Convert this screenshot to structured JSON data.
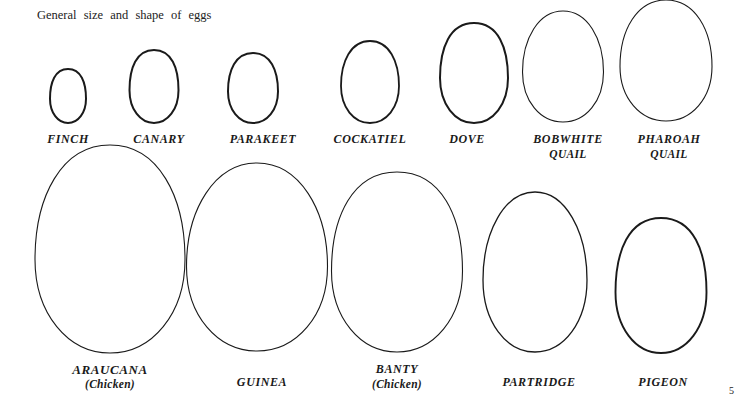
{
  "page": {
    "title": "General size and shape of eggs",
    "page_number": "5"
  },
  "eggs": [
    {
      "name": "FINCH",
      "sub": "",
      "cx": 68,
      "top": 69,
      "bottom": 123,
      "w": 36,
      "stroke": 2.0,
      "taper": 0.04,
      "label_x": 68,
      "label_y": 132
    },
    {
      "name": "CANARY",
      "sub": "",
      "cx": 154,
      "top": 50,
      "bottom": 123,
      "w": 49,
      "stroke": 2.0,
      "taper": 0.04,
      "label_x": 159,
      "label_y": 132
    },
    {
      "name": "PARAKEET",
      "sub": "",
      "cx": 253,
      "top": 53,
      "bottom": 123,
      "w": 50,
      "stroke": 2.0,
      "taper": 0.07,
      "label_x": 263,
      "label_y": 132
    },
    {
      "name": "COCKATIEL",
      "sub": "",
      "cx": 370,
      "top": 41,
      "bottom": 123,
      "w": 58,
      "stroke": 1.8,
      "taper": 0.12,
      "label_x": 370,
      "label_y": 132
    },
    {
      "name": "DOVE",
      "sub": "",
      "cx": 474,
      "top": 23,
      "bottom": 123,
      "w": 68,
      "stroke": 2.0,
      "taper": 0.05,
      "label_x": 467,
      "label_y": 132
    },
    {
      "name": "BOBWHITE",
      "sub": "QUAIL",
      "cx": 563,
      "top": 11,
      "bottom": 122,
      "w": 81,
      "stroke": 1.1,
      "taper": 0.2,
      "label_x": 568,
      "label_y": 132
    },
    {
      "name": "PHAROAH",
      "sub": "QUAIL",
      "cx": 666,
      "top": 0,
      "bottom": 121,
      "w": 92,
      "stroke": 1.1,
      "taper": 0.16,
      "label_x": 669,
      "label_y": 132
    },
    {
      "name": "ARAUCANA",
      "sub": "(Chicken)",
      "cx": 110,
      "top": 145,
      "bottom": 353,
      "w": 150,
      "stroke": 1.1,
      "taper": 0.14,
      "label_x": 110,
      "label_y": 362,
      "big": true
    },
    {
      "name": "GUINEA",
      "sub": "",
      "cx": 257,
      "top": 163,
      "bottom": 351,
      "w": 141,
      "stroke": 1.1,
      "taper": 0.2,
      "label_x": 262,
      "label_y": 375
    },
    {
      "name": "BANTY",
      "sub": "(Chicken)",
      "cx": 397,
      "top": 172,
      "bottom": 352,
      "w": 131,
      "stroke": 1.1,
      "taper": 0.1,
      "label_x": 397,
      "label_y": 362
    },
    {
      "name": "PARTRIDGE",
      "sub": "",
      "cx": 535,
      "top": 192,
      "bottom": 352,
      "w": 104,
      "stroke": 1.3,
      "taper": 0.22,
      "label_x": 539,
      "label_y": 375
    },
    {
      "name": "PIGEON",
      "sub": "",
      "cx": 661,
      "top": 218,
      "bottom": 353,
      "w": 91,
      "stroke": 1.9,
      "taper": 0.05,
      "label_x": 663,
      "label_y": 375
    }
  ],
  "colors": {
    "ink": "#1a1a1a",
    "paper": "#ffffff"
  }
}
